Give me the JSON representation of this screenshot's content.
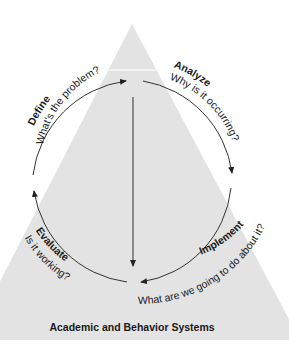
{
  "diagram": {
    "type": "problem-solving cycle within triangle",
    "colors": {
      "triangle_fill": "#e3e3e3",
      "band": "#f0f0f0",
      "stroke": "#333333",
      "background": "#ffffff"
    },
    "steps": [
      {
        "name": "Define",
        "question": "What's the problem?"
      },
      {
        "name": "Analyze",
        "question": "Why is it occurring?"
      },
      {
        "name": "Implement",
        "question": "What are we going to do about it?"
      },
      {
        "name": "Evaluate",
        "question": "Is it working?"
      }
    ],
    "caption": "Academic and Behavior Systems"
  }
}
